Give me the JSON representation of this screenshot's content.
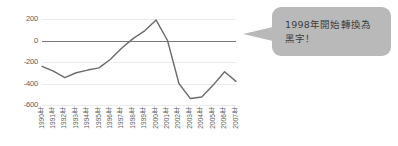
{
  "chart_data": {
    "type": "line",
    "title": "",
    "subtitle": "",
    "xlabel": "",
    "ylabel": "",
    "ylim": [
      -600,
      200
    ],
    "xlim": [
      1990,
      2007
    ],
    "yticks": [
      200,
      0,
      -200,
      -400,
      -600
    ],
    "grid": true,
    "legend": null,
    "legend_position": "none",
    "categories": [
      "1990年",
      "1991年",
      "1992年",
      "1993年",
      "1994年",
      "1995年",
      "1996年",
      "1997年",
      "1998年",
      "1999年",
      "2000年",
      "2001年",
      "2002年",
      "2003年",
      "2004年",
      "2005年",
      "2006年",
      "2007年"
    ],
    "series": [
      {
        "name": "",
        "values": [
          -240,
          -285,
          -345,
          -300,
          -275,
          -255,
          -175,
          -70,
          20,
          90,
          190,
          0,
          -400,
          -540,
          -525,
          -415,
          -290,
          -380
        ]
      }
    ],
    "annotations": [
      {
        "text": "1998年開始轉換為\n黑字！",
        "target_category": "1998年",
        "style": "callout-bubble"
      }
    ],
    "colors": {
      "line": "#6b6b6b",
      "zero_axis": "#7a7a7a",
      "gridline": "#ebebeb",
      "tick_label": "#595959",
      "callout_background": "#b9b9b9",
      "callout_text": "#3d3d3d",
      "plot_background": "#ffffff"
    }
  },
  "callout": {
    "text": "1998年開始轉換為\n黑字！"
  },
  "axis": {
    "y_tick_labels": [
      "200",
      "0",
      "-200",
      "-400",
      "-600"
    ]
  }
}
